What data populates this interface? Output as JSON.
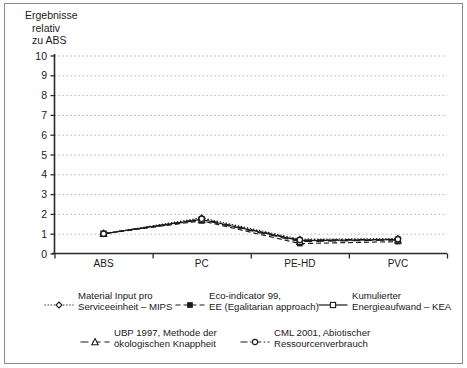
{
  "chart_data": {
    "type": "line",
    "title": "",
    "ylabel": "Ergebnisse relativ zu ABS",
    "ylabel_lines": [
      "Ergebnisse",
      "relativ",
      "zu ABS"
    ],
    "xlabel": "",
    "categories": [
      "ABS",
      "PC",
      "PE-HD",
      "PVC"
    ],
    "ylim": [
      0,
      10
    ],
    "yticks": [
      "0",
      "1",
      "2",
      "3",
      "4",
      "5",
      "6",
      "7",
      "8",
      "9",
      "10"
    ],
    "grid": "horizontal-dotted",
    "legend_position": "bottom",
    "series": [
      {
        "name": "Material Input pro Serviceeinheit – MIPS",
        "name_lines": [
          "Material Input pro",
          "Serviceeinheit – MIPS"
        ],
        "values": [
          1.0,
          1.8,
          0.72,
          0.75
        ],
        "marker": "diamond-open",
        "dash": "dotted",
        "color": "#1a1a1a"
      },
      {
        "name": "Eco-indicator 99, EE (Egalitarian approach)",
        "name_lines": [
          "Eco-indicator 99,",
          "EE (Egalitarian approach)"
        ],
        "values": [
          1.0,
          1.65,
          0.5,
          0.6
        ],
        "marker": "square-filled",
        "dash": "dashed",
        "color": "#1a1a1a"
      },
      {
        "name": "Kumulierter Energieaufwand – KEA",
        "name_lines": [
          "Kumulierter",
          "Energieaufwand – KEA"
        ],
        "values": [
          1.0,
          1.72,
          0.65,
          0.7
        ],
        "marker": "square-open",
        "dash": "solid",
        "color": "#1a1a1a"
      },
      {
        "name": "UBP 1997, Methode der ökologischen Knappheit",
        "name_lines": [
          "UBP 1997, Methode der",
          "ökologischen Knappheit"
        ],
        "values": [
          1.0,
          1.7,
          0.6,
          0.68
        ],
        "marker": "triangle-open",
        "dash": "long-dash",
        "color": "#1a1a1a"
      },
      {
        "name": "CML 2001, Abiotischer Ressourcenverbrauch",
        "name_lines": [
          "CML 2001, Abiotischer",
          "Ressourcenverbrauch"
        ],
        "values": [
          1.0,
          1.75,
          0.68,
          0.72
        ],
        "marker": "circle-open",
        "dash": "dash-dot",
        "color": "#1a1a1a"
      }
    ]
  },
  "axis": {
    "title_line1": "Ergebnisse",
    "title_line2": "relativ",
    "title_line3": "zu ABS",
    "y_ticks": [
      "10",
      "9",
      "8",
      "7",
      "6",
      "5",
      "4",
      "3",
      "2",
      "1",
      "0"
    ],
    "x_ticks": [
      "ABS",
      "PC",
      "PE-HD",
      "PVC"
    ]
  },
  "legend": {
    "items": [
      {
        "line1": "Material Input pro",
        "line2": "Serviceeinheit – MIPS",
        "key": "mips-key"
      },
      {
        "line1": "Eco-indicator 99,",
        "line2": "EE (Egalitarian approach)",
        "key": "eco99-key"
      },
      {
        "line1": "Kumulierter",
        "line2": "Energieaufwand – KEA",
        "key": "kea-key"
      },
      {
        "line1": "UBP 1997, Methode der",
        "line2": "ökologischen Knappheit",
        "key": "ubp-key"
      },
      {
        "line1": "CML 2001, Abiotischer",
        "line2": "Ressourcenverbrauch",
        "key": "cml-key"
      }
    ]
  },
  "colors": {
    "ink": "#1a1a1a",
    "frame": "#8a8a8a",
    "grid": "#b6b6b6",
    "axis": "#2b2b2b",
    "background": "#ffffff"
  }
}
